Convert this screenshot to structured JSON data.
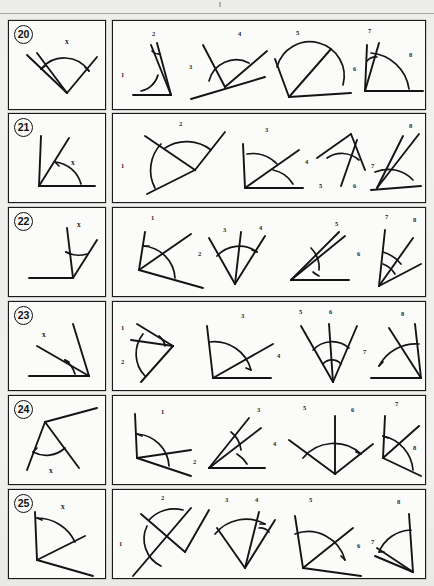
{
  "page": {
    "background_color": "#efefed",
    "ink_color": "#141414",
    "border_color": "#1a1a1a",
    "width": 434,
    "height": 586,
    "scan_top_rule": true
  },
  "labels": {
    "stimulus_angle_label": "x",
    "option_numbers": [
      "1",
      "2",
      "3",
      "4",
      "5",
      "6",
      "7",
      "8"
    ]
  },
  "rows": [
    {
      "number": "20",
      "item_label": "20",
      "stimulus": {
        "angle_label": "x",
        "description": "Vertex at bottom; three rays fanning upward, arc marks angle between left-most and right rays"
      },
      "options": [
        {
          "number": "1",
          "label_position": "left"
        },
        {
          "number": "2",
          "label_position": "top"
        },
        {
          "number": "3",
          "label_position": "left"
        },
        {
          "number": "4",
          "label_position": "top"
        },
        {
          "number": "5",
          "label_position": "top"
        },
        {
          "number": "6",
          "label_position": "right"
        },
        {
          "number": "7",
          "label_position": "top"
        },
        {
          "number": "8",
          "label_position": "right"
        }
      ]
    },
    {
      "number": "21",
      "item_label": "21",
      "stimulus": {
        "angle_label": "x",
        "description": "Vertex at bottom-left, horizontal ray right and steep ray up, arc labelled x"
      },
      "options": [
        {
          "number": "1",
          "label_position": "left"
        },
        {
          "number": "2",
          "label_position": "top"
        },
        {
          "number": "3",
          "label_position": "top"
        },
        {
          "number": "4",
          "label_position": "right"
        },
        {
          "number": "5",
          "label_position": "bottom"
        },
        {
          "number": "6",
          "label_position": "bottom"
        },
        {
          "number": "7",
          "label_position": "left"
        },
        {
          "number": "8",
          "label_position": "top"
        }
      ]
    },
    {
      "number": "22",
      "item_label": "22",
      "stimulus": {
        "angle_label": "x",
        "description": "Vertex at lower right, horizontal ray to the left and narrow V opening upward, arc labelled x"
      },
      "options": [
        {
          "number": "1",
          "label_position": "top"
        },
        {
          "number": "2",
          "label_position": "right"
        },
        {
          "number": "3",
          "label_position": "top"
        },
        {
          "number": "4",
          "label_position": "top"
        },
        {
          "number": "5",
          "label_position": "top"
        },
        {
          "number": "6",
          "label_position": "right"
        },
        {
          "number": "7",
          "label_position": "top"
        },
        {
          "number": "8",
          "label_position": "top"
        }
      ]
    },
    {
      "number": "23",
      "item_label": "23",
      "stimulus": {
        "angle_label": "x",
        "description": "Vertex at bottom right, horizontal ray left and two rays up-left, arc labelled x"
      },
      "options": [
        {
          "number": "1",
          "label_position": "left"
        },
        {
          "number": "2",
          "label_position": "left"
        },
        {
          "number": "3",
          "label_position": "top"
        },
        {
          "number": "4",
          "label_position": "right"
        },
        {
          "number": "5",
          "label_position": "top"
        },
        {
          "number": "6",
          "label_position": "top"
        },
        {
          "number": "7",
          "label_position": "left"
        },
        {
          "number": "8",
          "label_position": "top"
        }
      ]
    },
    {
      "number": "24",
      "item_label": "24",
      "stimulus": {
        "angle_label": "x",
        "description": "Vertex near top, two rays descending forming a lambda, arc labelled x below"
      },
      "options": [
        {
          "number": "1",
          "label_position": "top"
        },
        {
          "number": "2",
          "label_position": "right"
        },
        {
          "number": "3",
          "label_position": "top"
        },
        {
          "number": "4",
          "label_position": "right"
        },
        {
          "number": "5",
          "label_position": "top"
        },
        {
          "number": "6",
          "label_position": "top"
        },
        {
          "number": "7",
          "label_position": "top"
        },
        {
          "number": "8",
          "label_position": "right"
        }
      ]
    },
    {
      "number": "25",
      "item_label": "25",
      "stimulus": {
        "angle_label": "x",
        "description": "Vertex at left, vertical ray up and ray to lower right, arc labelled x"
      },
      "options": [
        {
          "number": "1",
          "label_position": "left"
        },
        {
          "number": "2",
          "label_position": "top"
        },
        {
          "number": "3",
          "label_position": "top"
        },
        {
          "number": "4",
          "label_position": "top"
        },
        {
          "number": "5",
          "label_position": "top"
        },
        {
          "number": "6",
          "label_position": "right"
        },
        {
          "number": "7",
          "label_position": "left"
        },
        {
          "number": "8",
          "label_position": "top"
        }
      ]
    }
  ]
}
